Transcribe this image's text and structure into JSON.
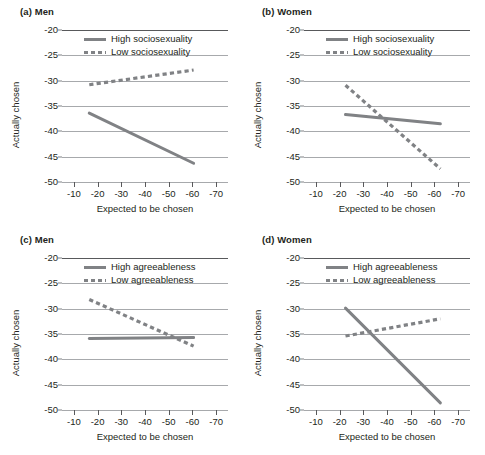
{
  "figure": {
    "width": 485,
    "height": 455,
    "background": "#ffffff",
    "line_color": "#808285",
    "grid_color": "#a7a9ac",
    "axis_color": "#58595b",
    "text_color": "#231f20"
  },
  "chart_data": [
    {
      "type": "line",
      "panel": "a",
      "label": "(a) Men",
      "title": "Men",
      "xlabel": "Expected to be chosen",
      "ylabel": "Actually chosen",
      "xlim": [
        -5,
        -75
      ],
      "ylim": [
        -20,
        -50
      ],
      "xticks": [
        -10,
        -20,
        -30,
        -40,
        -50,
        -60,
        -70
      ],
      "xticklabels": [
        "-10",
        "-20",
        "-30",
        "-40",
        "-50",
        "-60",
        "-70"
      ],
      "yticks": [
        -50,
        -45,
        -40,
        -35,
        -30,
        -25,
        -20
      ],
      "yticklabels": [
        "-50",
        "-45",
        "-40",
        "-35",
        "-30",
        "-25",
        "-20"
      ],
      "grid": true,
      "legend_position": "top-left-inside",
      "series": [
        {
          "name": "High sociosexuality",
          "style": "solid",
          "x": [
            -16.5,
            -60.5
          ],
          "values": [
            -36.4,
            -46.3
          ]
        },
        {
          "name": "Low sociosexuality",
          "style": "dashed",
          "x": [
            -16.5,
            -60.5
          ],
          "values": [
            -30.8,
            -27.9
          ]
        }
      ]
    },
    {
      "type": "line",
      "panel": "b",
      "label": "(b) Women",
      "title": "Women",
      "xlabel": "Expected to be chosen",
      "ylabel": "Actually chosen",
      "xlim": [
        -5,
        -75
      ],
      "ylim": [
        -20,
        -50
      ],
      "xticks": [
        -10,
        -20,
        -30,
        -40,
        -50,
        -60,
        -70
      ],
      "xticklabels": [
        "-10",
        "-20",
        "-30",
        "-40",
        "-50",
        "-60",
        "-70"
      ],
      "yticks": [
        -50,
        -45,
        -40,
        -35,
        -30,
        -25,
        -20
      ],
      "yticklabels": [
        "-50",
        "-45",
        "-40",
        "-35",
        "-30",
        "-25",
        "-20"
      ],
      "grid": true,
      "legend_position": "top-left-inside",
      "series": [
        {
          "name": "High sociosexuality",
          "style": "solid",
          "x": [
            -22.5,
            -62.5
          ],
          "values": [
            -36.7,
            -38.5
          ]
        },
        {
          "name": "Low sociosexuality",
          "style": "dashed",
          "x": [
            -22.5,
            -62.5
          ],
          "values": [
            -30.9,
            -47.4
          ]
        }
      ]
    },
    {
      "type": "line",
      "panel": "c",
      "label": "(c) Men",
      "title": "Men",
      "xlabel": "Expected to be chosen",
      "ylabel": "Actually chosen",
      "xlim": [
        -5,
        -75
      ],
      "ylim": [
        -20,
        -50
      ],
      "xticks": [
        -10,
        -20,
        -30,
        -40,
        -50,
        -60,
        -70
      ],
      "xticklabels": [
        "-10",
        "-20",
        "-30",
        "-40",
        "-50",
        "-60",
        "-70"
      ],
      "yticks": [
        -50,
        -45,
        -40,
        -35,
        -30,
        -25,
        -20
      ],
      "yticklabels": [
        "-50",
        "-45",
        "-40",
        "-35",
        "-30",
        "-25",
        "-20"
      ],
      "grid": true,
      "legend_position": "top-left-inside",
      "series": [
        {
          "name": "High agreeableness",
          "style": "solid",
          "x": [
            -16.5,
            -60.5
          ],
          "values": [
            -35.9,
            -35.7
          ]
        },
        {
          "name": "Low agreeableness",
          "style": "dashed",
          "x": [
            -16.5,
            -60.5
          ],
          "values": [
            -28.2,
            -37.4
          ]
        }
      ]
    },
    {
      "type": "line",
      "panel": "d",
      "label": "(d) Women",
      "title": "Women",
      "xlabel": "Expected to be chosen",
      "ylabel": "Actually chosen",
      "xlim": [
        -5,
        -75
      ],
      "ylim": [
        -20,
        -50
      ],
      "xticks": [
        -10,
        -20,
        -30,
        -40,
        -50,
        -60,
        -70
      ],
      "xticklabels": [
        "-10",
        "-20",
        "-30",
        "-40",
        "-50",
        "-60",
        "-70"
      ],
      "yticks": [
        -50,
        -45,
        -40,
        -35,
        -30,
        -25,
        -20
      ],
      "yticklabels": [
        "-50",
        "-45",
        "-40",
        "-35",
        "-30",
        "-25",
        "-20"
      ],
      "grid": true,
      "legend_position": "top-left-inside",
      "series": [
        {
          "name": "High agreeableness",
          "style": "solid",
          "x": [
            -22.5,
            -62.5
          ],
          "values": [
            -29.9,
            -48.6
          ]
        },
        {
          "name": "Low agreeableness",
          "style": "dashed",
          "x": [
            -22.5,
            -62.5
          ],
          "values": [
            -35.4,
            -32.0
          ]
        }
      ]
    }
  ]
}
